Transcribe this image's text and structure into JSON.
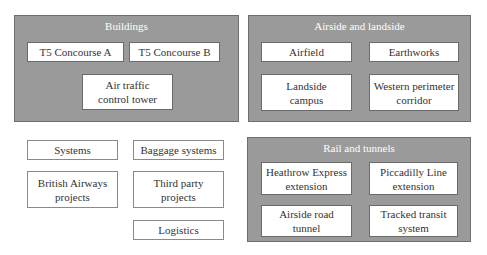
{
  "groups": [
    {
      "title": "Buildings",
      "items": [
        "T5 Concourse A",
        "T5 Concourse B",
        "Air traffic control tower"
      ]
    },
    {
      "title": "Airside and landside",
      "items": [
        "Airfield",
        "Earthworks",
        "Landside campus",
        "Western perimeter corridor"
      ]
    },
    {
      "title": "Rail and tunnels",
      "items": [
        "Heathrow Express extension",
        "Piccadilly Line extension",
        "Airside road tunnel",
        "Tracked transit system"
      ]
    }
  ],
  "standalone": [
    "Systems",
    "Baggage systems",
    "British Airways projects",
    "Third party projects",
    "Logistics"
  ],
  "colors": {
    "panel_fill": "#9a9a9a",
    "panel_title": "#ffffff",
    "box_fill": "#ffffff"
  }
}
